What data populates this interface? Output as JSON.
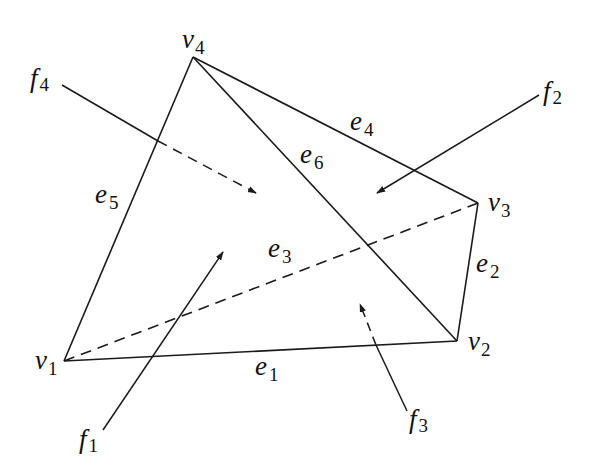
{
  "diagram": {
    "type": "tetrahedron",
    "colors": {
      "stroke": "#1a1a1a",
      "text": "#111111",
      "background": "#ffffff"
    },
    "vertices": [
      {
        "id": "v1",
        "base": "v",
        "sub": "1",
        "x": 64,
        "y": 361
      },
      {
        "id": "v2",
        "base": "v",
        "sub": "2",
        "x": 457,
        "y": 341
      },
      {
        "id": "v3",
        "base": "v",
        "sub": "3",
        "x": 478,
        "y": 203
      },
      {
        "id": "v4",
        "base": "v",
        "sub": "4",
        "x": 193,
        "y": 57
      }
    ],
    "edges": [
      {
        "id": "e1",
        "base": "e",
        "sub": "1",
        "from": "v1",
        "to": "v2",
        "style": "solid"
      },
      {
        "id": "e2",
        "base": "e",
        "sub": "2",
        "from": "v2",
        "to": "v3",
        "style": "solid"
      },
      {
        "id": "e3",
        "base": "e",
        "sub": "3",
        "from": "v1",
        "to": "v3",
        "style": "dashed"
      },
      {
        "id": "e4",
        "base": "e",
        "sub": "4",
        "from": "v4",
        "to": "v3",
        "style": "solid"
      },
      {
        "id": "e5",
        "base": "e",
        "sub": "5",
        "from": "v1",
        "to": "v4",
        "style": "solid"
      },
      {
        "id": "e6",
        "base": "e",
        "sub": "6",
        "from": "v4",
        "to": "v2",
        "style": "solid"
      }
    ],
    "faces": [
      {
        "id": "f1",
        "base": "f",
        "sub": "1"
      },
      {
        "id": "f2",
        "base": "f",
        "sub": "2"
      },
      {
        "id": "f3",
        "base": "f",
        "sub": "3"
      },
      {
        "id": "f4",
        "base": "f",
        "sub": "4"
      }
    ]
  }
}
